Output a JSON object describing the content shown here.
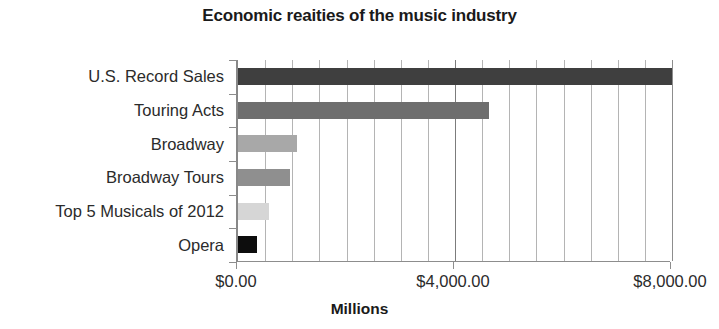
{
  "chart_data": {
    "type": "bar",
    "orientation": "horizontal",
    "title": "Economic reaities of the music industry",
    "xlabel": "Millions",
    "ylabel": "",
    "categories": [
      "U.S. Record Sales",
      "Touring Acts",
      "Broadway",
      "Broadway Tours",
      "Top 5 Musicals of 2012",
      "Opera"
    ],
    "values": [
      8000,
      4625,
      1085,
      955,
      570,
      350
    ],
    "bar_colors": [
      "#3f3f3f",
      "#6e6e6e",
      "#a8a8a8",
      "#8f8f8f",
      "#d6d6d6",
      "#0d0d0d"
    ],
    "xlim": [
      0,
      8000
    ],
    "xtick_labels": [
      "$0.00",
      "$4,000.00",
      "$8,000.00"
    ],
    "xtick_values": [
      0,
      4000,
      8000
    ],
    "minor_gridline_step": 500,
    "major_gridline_values": [
      4000
    ],
    "grid": true,
    "legend": "none"
  }
}
